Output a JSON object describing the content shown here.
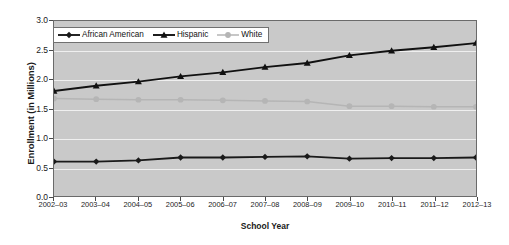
{
  "chart_data": {
    "type": "line",
    "title": "",
    "xlabel": "School Year",
    "ylabel": "Enrollment (in Millions)",
    "ylim": [
      0.0,
      3.0
    ],
    "ytick_step": 0.5,
    "yticks": [
      "0.0",
      "0.5",
      "1.0",
      "1.5",
      "2.0",
      "2.5",
      "3.0"
    ],
    "grid": true,
    "legend_position": "top-left",
    "categories": [
      "2002–03",
      "2003–04",
      "2004–05",
      "2005–06",
      "2006–07",
      "2007–08",
      "2008–09",
      "2009–10",
      "2010–11",
      "2011–12",
      "2012–13"
    ],
    "series": [
      {
        "name": "African American",
        "marker": "diamond",
        "color": "#1a1a1a",
        "values": [
          0.59,
          0.59,
          0.61,
          0.66,
          0.66,
          0.67,
          0.68,
          0.64,
          0.65,
          0.65,
          0.66
        ]
      },
      {
        "name": "Hispanic",
        "marker": "triangle",
        "color": "#111111",
        "values": [
          1.8,
          1.89,
          1.96,
          2.05,
          2.12,
          2.21,
          2.28,
          2.41,
          2.49,
          2.55,
          2.62
        ]
      },
      {
        "name": "White",
        "marker": "circle",
        "color": "#b5b5b5",
        "values": [
          1.67,
          1.66,
          1.65,
          1.65,
          1.64,
          1.63,
          1.62,
          1.54,
          1.54,
          1.53,
          1.53
        ]
      }
    ]
  },
  "colors": {
    "plot_background": "#c9c9c9",
    "gridline": "#efefef",
    "axis": "#4a4a4a",
    "page_background": "#ffffff"
  }
}
